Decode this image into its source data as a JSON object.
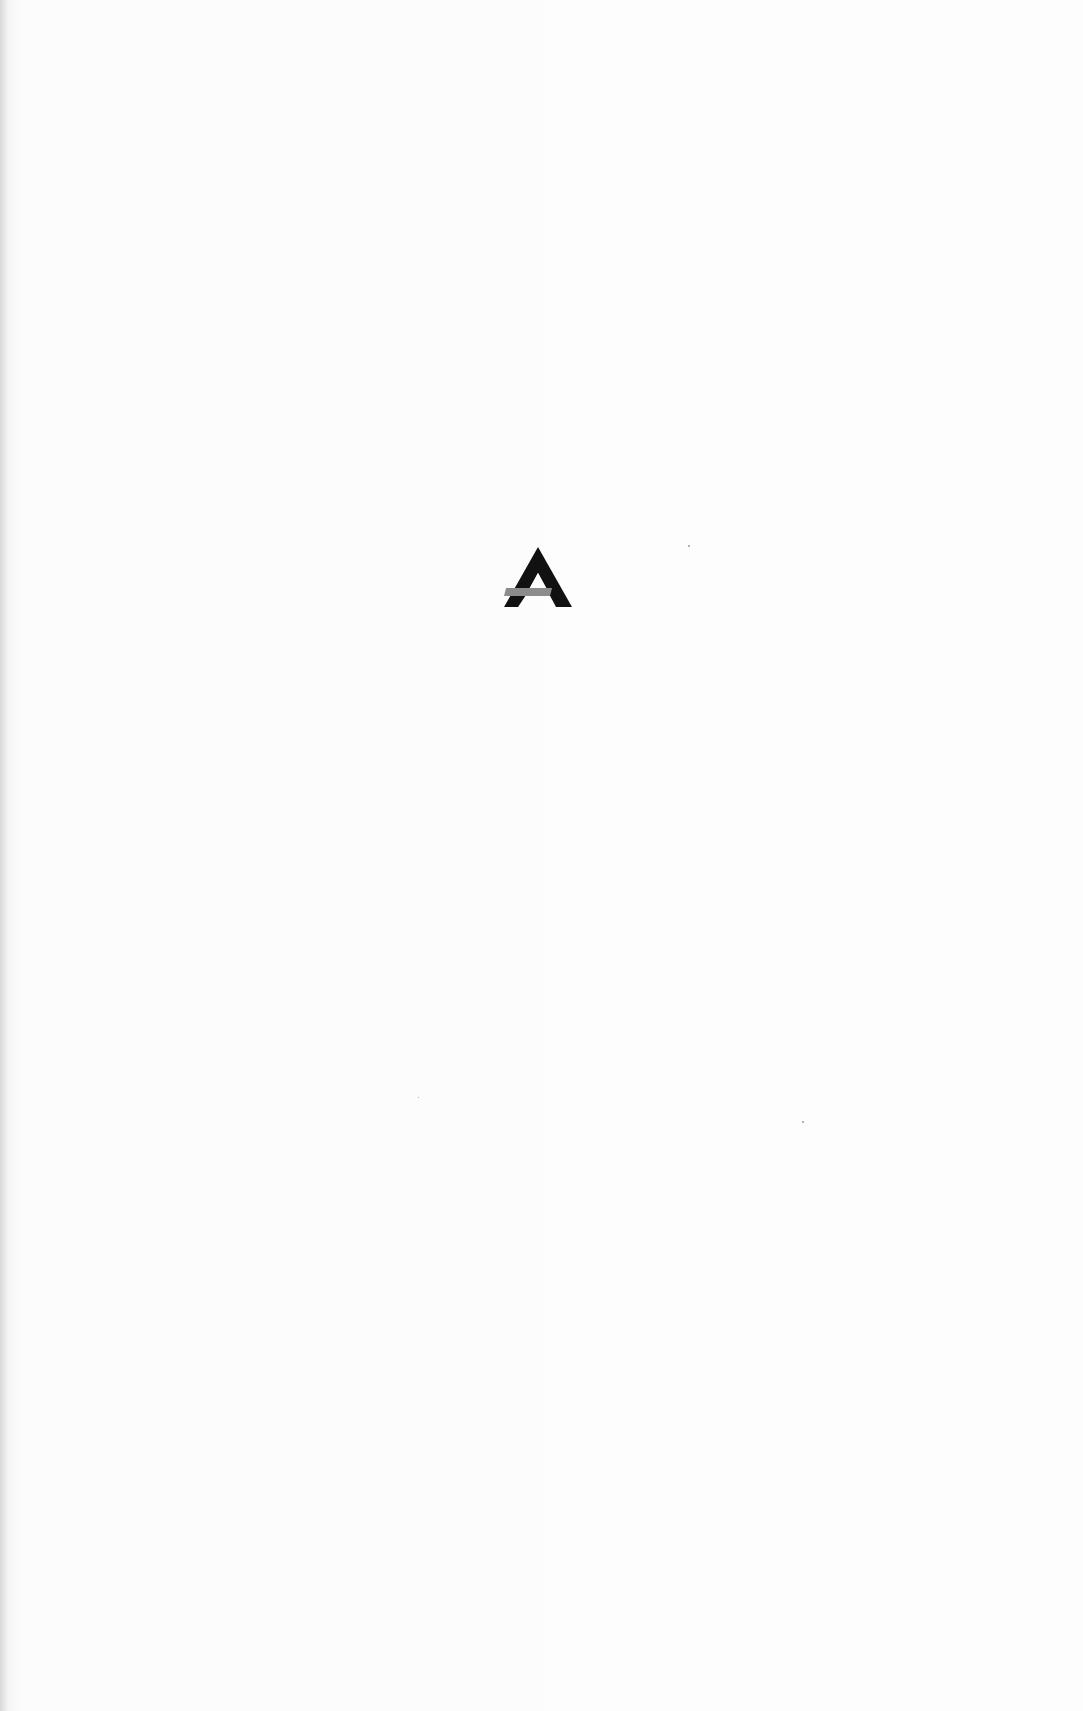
{
  "page": {
    "type": "blank-page-with-logo",
    "background": "#fdfdfd"
  },
  "logo": {
    "icon": "publisher-a-logo-icon",
    "shape": "triangular letter A",
    "primary_color": "#111111",
    "bar_color": "#8c8c8c"
  }
}
